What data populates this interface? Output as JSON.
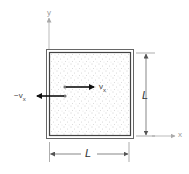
{
  "figure": {
    "type": "physics-diagram",
    "colors": {
      "box_border": "#555555",
      "axis": "#aaaaaa",
      "dimension": "#555555",
      "arrow": "#111111",
      "particles": "#9a9a9a",
      "background": "#ffffff"
    }
  },
  "axes": {
    "y_label": "y",
    "x_label": "x"
  },
  "dimensions": {
    "side_label": "L",
    "width_label": "L",
    "height_label": "L"
  },
  "velocities": {
    "incoming": {
      "label_main": "v",
      "label_sub": "x",
      "direction": "right"
    },
    "outgoing": {
      "label_prefix": "−",
      "label_main": "v",
      "label_sub": "x",
      "direction": "left"
    }
  }
}
